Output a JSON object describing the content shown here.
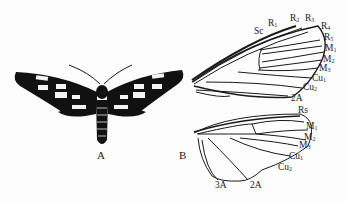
{
  "figure": {
    "panels": [
      {
        "id": "A",
        "label": "A",
        "content": "moth dorsal view, black wings with white spots"
      },
      {
        "id": "B",
        "label": "B",
        "content": "wing venation: forewing (top) and hindwing (bottom)"
      }
    ],
    "forewing_veins": [
      {
        "main": "Sc",
        "sub": ""
      },
      {
        "main": "R",
        "sub": "1"
      },
      {
        "main": "R",
        "sub": "2"
      },
      {
        "main": "R",
        "sub": "3"
      },
      {
        "main": "R",
        "sub": "4"
      },
      {
        "main": "R",
        "sub": "5"
      },
      {
        "main": "M",
        "sub": "1"
      },
      {
        "main": "M",
        "sub": "2"
      },
      {
        "main": "M",
        "sub": "3"
      },
      {
        "main": "Cu",
        "sub": "1"
      },
      {
        "main": "Cu",
        "sub": "2"
      },
      {
        "main": "2A",
        "sub": ""
      }
    ],
    "hindwing_veins": [
      {
        "main": "Rs",
        "sub": ""
      },
      {
        "main": "M",
        "sub": "1"
      },
      {
        "main": "M",
        "sub": "2"
      },
      {
        "main": "M",
        "sub": "3"
      },
      {
        "main": "Cu",
        "sub": "1"
      },
      {
        "main": "Cu",
        "sub": "2"
      },
      {
        "main": "2A",
        "sub": ""
      },
      {
        "main": "3A",
        "sub": ""
      }
    ],
    "colors": {
      "ink": "#1a1a1a",
      "background": "#fdfdfd"
    }
  }
}
